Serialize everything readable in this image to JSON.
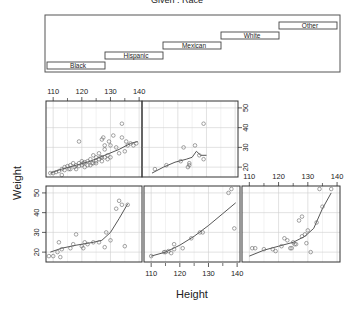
{
  "chart_data": {
    "type": "scatter",
    "subtype": "conditioning-plot (coplot)",
    "title": "Given : Race",
    "xlabel": "Height",
    "ylabel": "Weight",
    "xlim": [
      107.5,
      141
    ],
    "ylim": [
      15,
      53.5
    ],
    "x_ticks": [
      110,
      120,
      130,
      140
    ],
    "y_ticks": [
      20,
      30,
      40,
      50
    ],
    "grid": true,
    "smoother": "loess line per panel",
    "given": {
      "variable": "Race",
      "levels": [
        "Black",
        "Hispanic",
        "Mexican",
        "White",
        "Other"
      ]
    },
    "panels": [
      {
        "level": "Black",
        "position": "bottom-left",
        "points": [
          [
            108.5,
            18
          ],
          [
            110,
            18
          ],
          [
            111.5,
            20
          ],
          [
            112,
            25
          ],
          [
            112.5,
            17.5
          ],
          [
            113,
            21.5
          ],
          [
            116,
            22
          ],
          [
            117,
            24
          ],
          [
            118,
            29
          ],
          [
            120,
            23
          ],
          [
            120.5,
            22
          ],
          [
            121,
            25
          ],
          [
            122,
            24
          ],
          [
            124,
            25
          ],
          [
            126,
            25
          ],
          [
            128,
            22.5
          ],
          [
            128.5,
            30
          ],
          [
            130,
            26
          ],
          [
            132,
            42
          ],
          [
            133,
            46
          ],
          [
            134,
            44
          ],
          [
            135,
            23
          ],
          [
            136,
            44
          ]
        ],
        "smooth": [
          [
            109,
            20
          ],
          [
            113,
            22
          ],
          [
            118,
            23.5
          ],
          [
            124,
            25
          ],
          [
            127,
            26
          ],
          [
            130,
            30
          ],
          [
            133,
            37
          ],
          [
            136,
            44.5
          ]
        ]
      },
      {
        "level": "Hispanic",
        "position": "bottom-center",
        "points": [
          [
            110,
            18
          ],
          [
            114.5,
            20
          ],
          [
            115,
            20
          ],
          [
            116,
            20.5
          ],
          [
            117,
            19.5
          ],
          [
            118,
            21.5
          ],
          [
            118,
            24
          ],
          [
            121,
            22
          ],
          [
            124,
            27
          ],
          [
            127,
            30
          ],
          [
            128,
            30
          ],
          [
            137,
            50
          ],
          [
            138,
            52
          ],
          [
            139,
            32
          ]
        ],
        "smooth": [
          [
            110,
            18
          ],
          [
            115,
            20
          ],
          [
            120,
            23.5
          ],
          [
            125,
            28
          ],
          [
            130,
            33.5
          ],
          [
            135,
            39.5
          ],
          [
            139.5,
            45
          ]
        ]
      },
      {
        "level": "Mexican",
        "position": "bottom-right",
        "points": [
          [
            107.5,
            14
          ],
          [
            111,
            22
          ],
          [
            112,
            22
          ],
          [
            115,
            21.5
          ],
          [
            118,
            21.5
          ],
          [
            119,
            20.5
          ],
          [
            121,
            23
          ],
          [
            122,
            27
          ],
          [
            123,
            26
          ],
          [
            124,
            22
          ],
          [
            124.5,
            22
          ],
          [
            125,
            25
          ],
          [
            125.5,
            24
          ],
          [
            126,
            24
          ],
          [
            127,
            36
          ],
          [
            128,
            38
          ],
          [
            128,
            28
          ],
          [
            129,
            29
          ],
          [
            129.5,
            24.5
          ],
          [
            130,
            31
          ],
          [
            131,
            20
          ],
          [
            133,
            35
          ],
          [
            134,
            52
          ],
          [
            135,
            43
          ],
          [
            138,
            52
          ]
        ],
        "smooth": [
          [
            110,
            18
          ],
          [
            115,
            21
          ],
          [
            120,
            23
          ],
          [
            125,
            25
          ],
          [
            129,
            28
          ],
          [
            132,
            32
          ],
          [
            135,
            42
          ],
          [
            138,
            50
          ]
        ]
      },
      {
        "level": "White",
        "position": "top-left",
        "points": [
          [
            109,
            17
          ],
          [
            110,
            17
          ],
          [
            111,
            17.5
          ],
          [
            112,
            18
          ],
          [
            113,
            16
          ],
          [
            113,
            19
          ],
          [
            114,
            18.5
          ],
          [
            114,
            20
          ],
          [
            115,
            20.5
          ],
          [
            115.5,
            19
          ],
          [
            116,
            21
          ],
          [
            116,
            19
          ],
          [
            117,
            22
          ],
          [
            117.5,
            20
          ],
          [
            118,
            19
          ],
          [
            118,
            21
          ],
          [
            119,
            22
          ],
          [
            119,
            20.5
          ],
          [
            119,
            33
          ],
          [
            120,
            21
          ],
          [
            120,
            23
          ],
          [
            120.5,
            22
          ],
          [
            121,
            22.5
          ],
          [
            121,
            20
          ],
          [
            122,
            21
          ],
          [
            122,
            23
          ],
          [
            123,
            24
          ],
          [
            123,
            21
          ],
          [
            123.5,
            22
          ],
          [
            124,
            22
          ],
          [
            124,
            26
          ],
          [
            125,
            25
          ],
          [
            125,
            23
          ],
          [
            125,
            22
          ],
          [
            126,
            24
          ],
          [
            126,
            27
          ],
          [
            126.5,
            25
          ],
          [
            127,
            23
          ],
          [
            127,
            25
          ],
          [
            127,
            34
          ],
          [
            127.5,
            35
          ],
          [
            128,
            25
          ],
          [
            128,
            29
          ],
          [
            128,
            31
          ],
          [
            129,
            26
          ],
          [
            129,
            24
          ],
          [
            129.5,
            33
          ],
          [
            130,
            25
          ],
          [
            130,
            31
          ],
          [
            131,
            36
          ],
          [
            132,
            30
          ],
          [
            133,
            27
          ],
          [
            134,
            42
          ],
          [
            134,
            35
          ],
          [
            135,
            28
          ],
          [
            135.5,
            33
          ],
          [
            136,
            31
          ],
          [
            137,
            32
          ],
          [
            138,
            31
          ],
          [
            139,
            32
          ]
        ],
        "smooth": [
          [
            109,
            17
          ],
          [
            113,
            19
          ],
          [
            118,
            21
          ],
          [
            123,
            23
          ],
          [
            128,
            26
          ],
          [
            133,
            29
          ],
          [
            137,
            32
          ],
          [
            139.5,
            33
          ]
        ]
      },
      {
        "level": "Other",
        "position": "top-center",
        "points": [
          [
            112,
            19
          ],
          [
            116,
            21
          ],
          [
            121,
            23
          ],
          [
            122,
            30
          ],
          [
            123.5,
            20
          ],
          [
            124,
            21
          ],
          [
            124,
            22
          ],
          [
            126,
            31
          ],
          [
            127.5,
            26
          ],
          [
            129,
            42
          ],
          [
            129,
            24
          ]
        ],
        "smooth": [
          [
            111,
            17
          ],
          [
            115,
            20
          ],
          [
            119,
            22.5
          ],
          [
            123,
            24
          ],
          [
            125,
            25
          ],
          [
            126.5,
            28
          ],
          [
            128,
            26
          ],
          [
            130,
            26
          ]
        ]
      }
    ],
    "shingle_panel": {
      "bars": [
        {
          "label": "Black",
          "row": 1
        },
        {
          "label": "Hispanic",
          "row": 2
        },
        {
          "label": "Mexican",
          "row": 3
        },
        {
          "label": "White",
          "row": 4
        },
        {
          "label": "Other",
          "row": 5
        }
      ]
    }
  }
}
